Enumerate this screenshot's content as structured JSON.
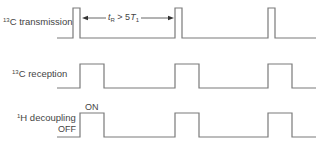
{
  "diagram": {
    "type": "pulse-timing-diagram",
    "rows": [
      {
        "id": "c13-transmission",
        "label_sup": "13",
        "label_text": "C transmission",
        "pulses": [
          [
            73,
            80
          ],
          [
            175,
            182
          ],
          [
            268,
            275
          ]
        ],
        "baseline_y": 38,
        "top_y": 8
      },
      {
        "id": "c13-reception",
        "label_sup": "13",
        "label_text": "C reception",
        "pulses": [
          [
            80,
            104
          ],
          [
            175,
            199
          ],
          [
            268,
            292
          ]
        ],
        "baseline_y": 88,
        "top_y": 64
      },
      {
        "id": "h1-decoupling",
        "label_sup": "1",
        "label_text": "H decoupling",
        "pulses": [
          [
            80,
            104
          ],
          [
            175,
            199
          ],
          [
            268,
            292
          ]
        ],
        "baseline_y": 137,
        "top_y": 113
      }
    ],
    "x_start": 57,
    "x_end": 316,
    "line_color": "#7a7a7a",
    "interval_arrow": {
      "from_x": 81,
      "to_x": 175,
      "y": 18,
      "label_main": "t",
      "label_sub": "R",
      "label_rel": " > 5",
      "label_T": "T",
      "label_T_sub": "1"
    },
    "state_labels": {
      "on": "ON",
      "off": "OFF"
    }
  }
}
